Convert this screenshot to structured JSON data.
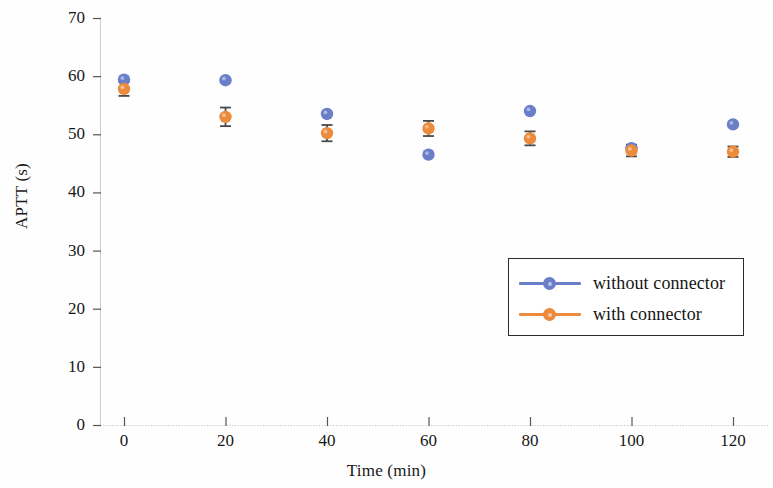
{
  "chart_data": {
    "type": "scatter",
    "title": "",
    "subtitle": "",
    "xlabel": "Time (min)",
    "ylabel": "APTT (s)",
    "x": [
      0,
      20,
      40,
      60,
      80,
      100,
      120
    ],
    "xtick_labels": [
      "0",
      "20",
      "40",
      "60",
      "80",
      "100",
      "120"
    ],
    "ytick_labels": [
      "0",
      "10",
      "20",
      "30",
      "40",
      "50",
      "60",
      "70"
    ],
    "yticks": [
      0,
      10,
      20,
      30,
      40,
      50,
      60,
      70
    ],
    "xlim": [
      -12,
      132
    ],
    "ylim": [
      0,
      70
    ],
    "grid": false,
    "legend_position": "center-right",
    "series": [
      {
        "name": "without connector",
        "color": "#6B7FC9",
        "marker": "circle",
        "values": [
          59.4,
          59.3,
          53.5,
          46.5,
          54.0,
          47.6,
          51.7
        ],
        "errors": [
          0.0,
          0.0,
          0.0,
          0.0,
          0.0,
          0.0,
          0.0
        ]
      },
      {
        "name": "with connector",
        "color": "#ED8B3C",
        "marker": "circle",
        "values": [
          57.8,
          53.0,
          50.2,
          51.0,
          49.3,
          47.2,
          47.0
        ],
        "errors": [
          1.2,
          1.6,
          1.4,
          1.3,
          1.2,
          1.0,
          0.9
        ]
      }
    ]
  },
  "legend": {
    "entries": [
      {
        "label": "without connector",
        "color": "#6B7FC9"
      },
      {
        "label": "with connector",
        "color": "#ED8B3C"
      }
    ]
  },
  "axes": {
    "x_title": "Time (min)",
    "y_title": "APTT (s)"
  },
  "colors": {
    "series_without_connector": "#6B7FC9",
    "series_with_connector": "#ED8B3C",
    "axis": "#3a3a3a",
    "error_bar": "#4a4a4a",
    "background": "#ffffff"
  }
}
